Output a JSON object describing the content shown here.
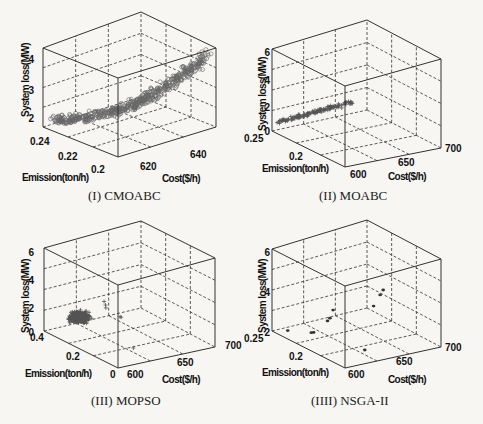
{
  "figure": {
    "captions": [
      "(I) CMOABC",
      "(II) MOABC",
      "(III) MOPSO",
      "(IIII) NSGA-II"
    ]
  },
  "chart_data": [
    {
      "type": "scatter3d",
      "title": "(I) CMOABC",
      "xlabel": "Cost($/h)",
      "ylabel": "Emission(ton/h)",
      "zlabel": "System loss(MW)",
      "x_ticks": [
        "620",
        "640"
      ],
      "y_ticks": [
        "0.2",
        "0.22",
        "0.24"
      ],
      "z_ticks": [
        "2",
        "3",
        "4"
      ],
      "xlim": [
        605,
        650
      ],
      "ylim": [
        0.2,
        0.25
      ],
      "zlim": [
        1.5,
        4.3
      ],
      "marker": "circle",
      "grid": true,
      "description": "Dense bowl-shaped front; loss rises from ~1.7 MW near low cost/high emission to ~4 MW at high cost/low emission",
      "points": [
        [
          608,
          0.245,
          1.8
        ],
        [
          612,
          0.24,
          1.75
        ],
        [
          616,
          0.235,
          1.7
        ],
        [
          620,
          0.23,
          1.75
        ],
        [
          624,
          0.225,
          1.8
        ],
        [
          628,
          0.22,
          1.95
        ],
        [
          632,
          0.215,
          2.1
        ],
        [
          636,
          0.21,
          2.4
        ],
        [
          640,
          0.205,
          2.8
        ],
        [
          644,
          0.203,
          3.3
        ],
        [
          648,
          0.201,
          3.9
        ]
      ]
    },
    {
      "type": "scatter3d",
      "title": "(II) MOABC",
      "xlabel": "Cost($/h)",
      "ylabel": "Emission(ton/h)",
      "zlabel": "System loss(MW)",
      "x_ticks": [
        "600",
        "650",
        "700"
      ],
      "y_ticks": [
        "0.2",
        "0.25"
      ],
      "z_ticks": [
        "0",
        "2",
        "4",
        "6"
      ],
      "xlim": [
        600,
        700
      ],
      "ylim": [
        0.18,
        0.25
      ],
      "zlim": [
        0,
        6
      ],
      "marker": "plus",
      "grid": true,
      "description": "Narrow linear front; loss ~1 to ~4 MW",
      "points": [
        [
          605,
          0.24,
          1.0
        ],
        [
          610,
          0.235,
          1.5
        ],
        [
          615,
          0.23,
          2.0
        ],
        [
          620,
          0.22,
          2.6
        ],
        [
          625,
          0.215,
          3.1
        ],
        [
          630,
          0.21,
          3.6
        ],
        [
          640,
          0.2,
          4.0
        ]
      ]
    },
    {
      "type": "scatter3d",
      "title": "(III) MOPSO",
      "xlabel": "Cost($/h)",
      "ylabel": "Emission(ton/h)",
      "zlabel": "System loss(MW)",
      "x_ticks": [
        "600",
        "650",
        "700"
      ],
      "y_ticks": [
        "0",
        "0.2",
        "0.4"
      ],
      "z_ticks": [
        "0",
        "2",
        "4",
        "6"
      ],
      "xlim": [
        600,
        700
      ],
      "ylim": [
        0,
        0.4
      ],
      "zlim": [
        0,
        6
      ],
      "marker": "plus",
      "grid": true,
      "description": "Dense blob cluster around loss 1.5-3 MW with few scattered outliers up to ~4 MW",
      "points": [
        [
          610,
          0.25,
          1.8
        ],
        [
          615,
          0.24,
          2.2
        ],
        [
          620,
          0.23,
          2.5
        ],
        [
          625,
          0.22,
          2.8
        ],
        [
          630,
          0.21,
          3.2
        ],
        [
          640,
          0.2,
          3.8
        ],
        [
          660,
          0.15,
          2.0
        ],
        [
          620,
          0.1,
          0.8
        ]
      ]
    },
    {
      "type": "scatter3d",
      "title": "(IIII) NSGA-II",
      "xlabel": "Cost($/h)",
      "ylabel": "Emission(ton/h)",
      "zlabel": "System loss(MW)",
      "x_ticks": [
        "600",
        "650",
        "700"
      ],
      "y_ticks": [
        "0.2",
        "0.25"
      ],
      "z_ticks": [
        "2",
        "4",
        "6"
      ],
      "xlim": [
        600,
        700
      ],
      "ylim": [
        0.18,
        0.25
      ],
      "zlim": [
        2,
        6
      ],
      "marker": "dot",
      "grid": true,
      "description": "Sparse set of ~10 points",
      "points": [
        [
          605,
          0.24,
          2.3
        ],
        [
          615,
          0.23,
          2.7
        ],
        [
          618,
          0.228,
          2.75
        ],
        [
          625,
          0.22,
          3.2
        ],
        [
          630,
          0.215,
          3.7
        ],
        [
          640,
          0.205,
          2.6
        ],
        [
          650,
          0.2,
          4.5
        ],
        [
          660,
          0.195,
          5.0
        ],
        [
          665,
          0.19,
          5.0
        ]
      ]
    }
  ],
  "panels": [
    {
      "id": "cmoabc",
      "zlabel": "System loss(MW)",
      "ylabel": "Emission(ton/h)",
      "xlabel": "Cost($/h)",
      "zticks": [
        {
          "t": "4",
          "x": 34,
          "y": 59
        },
        {
          "t": "3",
          "x": 34,
          "y": 90
        },
        {
          "t": "2",
          "x": 34,
          "y": 118
        }
      ],
      "yticks": [
        {
          "t": "0.24",
          "x": 30,
          "y": 145
        },
        {
          "t": "0.22",
          "x": 58,
          "y": 160
        },
        {
          "t": "0.2",
          "x": 91,
          "y": 173
        }
      ],
      "xticks": [
        {
          "t": "620",
          "x": 140,
          "y": 170
        },
        {
          "t": "640",
          "x": 190,
          "y": 158
        }
      ],
      "zlabel_pos": {
        "x": 29,
        "y": 80
      },
      "ylabel_pos": {
        "x": 22,
        "y": 181
      },
      "xlabel_pos": {
        "x": 162,
        "y": 182
      },
      "box": {
        "bl": [
          43,
          127
        ],
        "bf": [
          118,
          157
        ],
        "br": [
          216,
          127
        ],
        "bb": [
          141,
          97
        ],
        "tl": [
          43,
          48
        ],
        "tf": [
          118,
          78
        ],
        "tr": [
          216,
          48
        ],
        "tb": [
          141,
          12
        ]
      },
      "marker": "circle",
      "color": "#555555"
    },
    {
      "id": "moabc",
      "zlabel": "System loss(MW)",
      "ylabel": "Emission(ton/h)",
      "xlabel": "Cost($/h)",
      "zticks": [
        {
          "t": "6",
          "x": 270,
          "y": 52
        },
        {
          "t": "4",
          "x": 270,
          "y": 80
        },
        {
          "t": "2",
          "x": 270,
          "y": 107
        },
        {
          "t": "0",
          "x": 270,
          "y": 131
        }
      ],
      "yticks": [
        {
          "t": "0.25",
          "x": 244,
          "y": 142
        },
        {
          "t": "0.2",
          "x": 289,
          "y": 160
        }
      ],
      "xticks": [
        {
          "t": "600",
          "x": 350,
          "y": 178
        },
        {
          "t": "650",
          "x": 398,
          "y": 166
        },
        {
          "t": "700",
          "x": 445,
          "y": 152
        }
      ],
      "zlabel_pos": {
        "x": 266,
        "y": 94
      },
      "ylabel_pos": {
        "x": 262,
        "y": 172
      },
      "xlabel_pos": {
        "x": 388,
        "y": 180
      },
      "box": {
        "bl": [
          272,
          131
        ],
        "bf": [
          345,
          167
        ],
        "br": [
          441,
          148
        ],
        "bb": [
          367,
          110
        ],
        "tl": [
          272,
          49
        ],
        "tf": [
          345,
          86
        ],
        "tr": [
          441,
          59
        ],
        "tb": [
          367,
          20
        ]
      },
      "marker": "plus",
      "color": "#555555"
    },
    {
      "id": "mopso",
      "zlabel": "System loss(MW)",
      "ylabel": "Emission(ton/h)",
      "xlabel": "Cost($/h)",
      "zticks": [
        {
          "t": "6",
          "x": 34,
          "y": 252
        },
        {
          "t": "4",
          "x": 34,
          "y": 280
        },
        {
          "t": "2",
          "x": 34,
          "y": 308
        },
        {
          "t": "0",
          "x": 34,
          "y": 332
        }
      ],
      "yticks": [
        {
          "t": "0.4",
          "x": 30,
          "y": 341
        },
        {
          "t": "0.2",
          "x": 66,
          "y": 360
        },
        {
          "t": "0",
          "x": 110,
          "y": 378
        }
      ],
      "xticks": [
        {
          "t": "600",
          "x": 127,
          "y": 378
        },
        {
          "t": "650",
          "x": 177,
          "y": 366
        },
        {
          "t": "700",
          "x": 225,
          "y": 349
        }
      ],
      "zlabel_pos": {
        "x": 29,
        "y": 296
      },
      "ylabel_pos": {
        "x": 25,
        "y": 377
      },
      "xlabel_pos": {
        "x": 162,
        "y": 383
      },
      "box": {
        "bl": [
          44,
          331
        ],
        "bf": [
          118,
          368
        ],
        "br": [
          215,
          347
        ],
        "bb": [
          141,
          308
        ],
        "tl": [
          44,
          248
        ],
        "tf": [
          118,
          285
        ],
        "tr": [
          215,
          258
        ],
        "tb": [
          141,
          221
        ]
      },
      "marker": "plus",
      "color": "#555555"
    },
    {
      "id": "nsga2",
      "zlabel": "System loss(MW)",
      "ylabel": "Emission(ton/h)",
      "xlabel": "Cost($/h)",
      "zticks": [
        {
          "t": "6",
          "x": 270,
          "y": 252
        },
        {
          "t": "4",
          "x": 270,
          "y": 292
        },
        {
          "t": "2",
          "x": 270,
          "y": 332
        }
      ],
      "yticks": [
        {
          "t": "0.25",
          "x": 244,
          "y": 342
        },
        {
          "t": "0.2",
          "x": 289,
          "y": 360
        }
      ],
      "xticks": [
        {
          "t": "600",
          "x": 348,
          "y": 378
        },
        {
          "t": "650",
          "x": 396,
          "y": 365
        },
        {
          "t": "700",
          "x": 445,
          "y": 351
        }
      ],
      "zlabel_pos": {
        "x": 266,
        "y": 296
      },
      "ylabel_pos": {
        "x": 262,
        "y": 376
      },
      "xlabel_pos": {
        "x": 388,
        "y": 383
      },
      "box": {
        "bl": [
          272,
          331
        ],
        "bf": [
          345,
          368
        ],
        "br": [
          441,
          347
        ],
        "bb": [
          367,
          308
        ],
        "tl": [
          272,
          249
        ],
        "tf": [
          345,
          286
        ],
        "tr": [
          441,
          259
        ],
        "tb": [
          367,
          220
        ]
      },
      "marker": "dot",
      "color": "#444444"
    }
  ]
}
